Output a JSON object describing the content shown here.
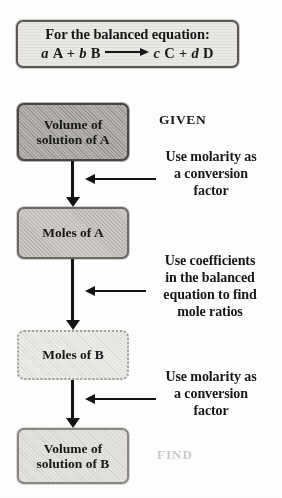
{
  "diagram": {
    "title_box": {
      "heading": "For the balanced equation:",
      "equation": {
        "coef_a": "a",
        "species_a": "A",
        "plus_1": "+",
        "coef_b": "b",
        "species_b": "B",
        "arrow": "⟶",
        "coef_c": "c",
        "species_c": "C",
        "plus_2": "+",
        "coef_d": "d",
        "species_d": "D",
        "full_text": "a A + b B ⟶ c C + d D"
      }
    },
    "steps": [
      {
        "id": "volume-solution-a",
        "line1": "Volume of",
        "line2": "solution of A",
        "shade": "dark"
      },
      {
        "id": "moles-a",
        "line1": "Moles of A",
        "line2": "",
        "shade": "mid"
      },
      {
        "id": "moles-b",
        "line1": "Moles of B",
        "line2": "",
        "shade": "light"
      },
      {
        "id": "volume-solution-b",
        "line1": "Volume of",
        "line2": "solution of B",
        "shade": "light2"
      }
    ],
    "labels": {
      "given": "GIVEN",
      "find": "FIND"
    },
    "annotations": [
      {
        "id": "molarity-conversion-1",
        "line1": "Use molarity as",
        "line2": "a conversion",
        "line3": "factor",
        "line4": ""
      },
      {
        "id": "coefficients-mole-ratio",
        "line1": "Use coefficients",
        "line2": "in the balanced",
        "line3": "equation to find",
        "line4": "mole ratios"
      },
      {
        "id": "molarity-conversion-2",
        "line1": "Use molarity as",
        "line2": "a conversion",
        "line3": "factor",
        "line4": ""
      }
    ],
    "colors": {
      "ink": "#1a1a1a",
      "page": "#ffffff",
      "box_dark": "#b8b5b0",
      "box_mid": "#cfccc7",
      "box_light": "#eeece9",
      "faded_text": "#7d7a76"
    }
  }
}
